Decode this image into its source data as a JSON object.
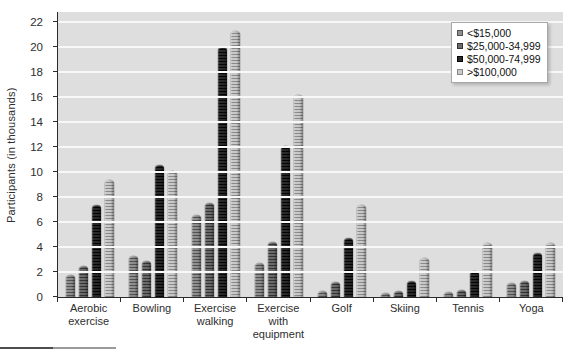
{
  "chart_data": {
    "type": "bar",
    "title": "",
    "xlabel": "",
    "ylabel": "Participants (in thousands)",
    "ylim": [
      0,
      22
    ],
    "ytick_step": 2,
    "grid": true,
    "legend_position": "top-right",
    "plot_bg": "#dedede",
    "categories": [
      "Aerobic\nexercise",
      "Bowling",
      "Exercise\nwalking",
      "Exercise\nwith\nequipment",
      "Golf",
      "Skiing",
      "Tennis",
      "Yoga"
    ],
    "series": [
      {
        "name": "<$15,000",
        "color": "#8f8f8f",
        "stripe": "#525252",
        "values": [
          1.8,
          3.3,
          6.6,
          2.7,
          0.5,
          0.3,
          0.4,
          1.1
        ]
      },
      {
        "name": "$25,000-34,999",
        "color": "#6b6b6b",
        "stripe": "#333333",
        "values": [
          2.5,
          2.9,
          7.5,
          4.4,
          1.2,
          0.5,
          0.6,
          1.3
        ]
      },
      {
        "name": "$50,000-74,999",
        "color": "#2a2a2a",
        "stripe": "#050505",
        "values": [
          7.4,
          10.6,
          20.0,
          12.1,
          4.7,
          1.3,
          2.1,
          3.5
        ]
      },
      {
        "name": ">$100,000",
        "color": "#c9c9c9",
        "stripe": "#8a8a8a",
        "values": [
          9.4,
          10.1,
          21.3,
          16.2,
          7.4,
          3.1,
          4.3,
          4.3
        ]
      }
    ]
  }
}
